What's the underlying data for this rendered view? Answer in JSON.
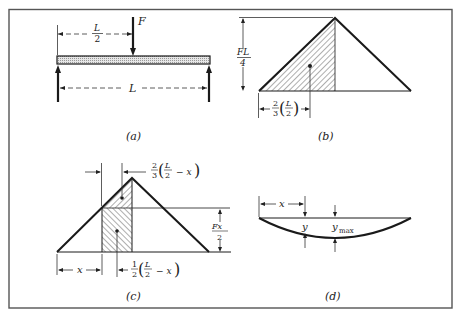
{
  "figure": {
    "panels": [
      {
        "id": "a",
        "caption": "(a)",
        "description": "Simply supported beam of length L with point load F at midspan",
        "labels": {
          "force": "F",
          "half_span_num": "L",
          "half_span_den": "2",
          "span": "L"
        }
      },
      {
        "id": "b",
        "caption": "(b)",
        "description": "Bending moment diagram, triangle with peak FL/4 at midspan; hatched left half with centroid",
        "labels": {
          "peak_num": "FL",
          "peak_den": "4",
          "centroid_coef_num": "2",
          "centroid_coef_den": "3",
          "centroid_inner_num": "L",
          "centroid_inner_den": "2"
        }
      },
      {
        "id": "c",
        "caption": "(c)",
        "description": "Moment diagram split at distance x into triangle and rectangle areas with centroids",
        "labels": {
          "top_coef_num": "2",
          "top_coef_den": "3",
          "top_inner_num": "L",
          "top_inner_den": "2",
          "top_minus": "− x",
          "height_num": "Fx",
          "height_den": "2",
          "x": "x",
          "bottom_coef_num": "1",
          "bottom_coef_den": "2",
          "bottom_inner_num": "L",
          "bottom_inner_den": "2",
          "bottom_minus": "− x"
        }
      },
      {
        "id": "d",
        "caption": "(d)",
        "description": "Deflected shape of beam showing deflection y at x and maximum deflection y_max",
        "labels": {
          "x": "x",
          "y": "y",
          "ymax_base": "y",
          "ymax_sub": "max"
        }
      }
    ],
    "colors": {
      "line": "#1a1a1a",
      "frame": "#555555",
      "hatch": "#333333"
    }
  }
}
